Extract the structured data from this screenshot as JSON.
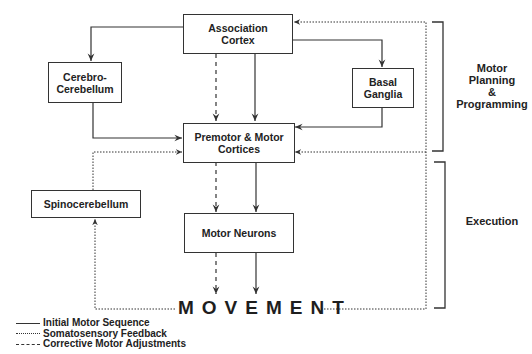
{
  "boxes": {
    "association_cortex": "Association\nCortex",
    "cerebro_cerebellum": "Cerebro-\nCerebellum",
    "basal_ganglia": "Basal\nGanglia",
    "premotor_motor": "Premotor & Motor\nCortices",
    "spinocerebellum": "Spinocerebellum",
    "motor_neurons": "Motor Neurons"
  },
  "output_label": "MOVEMENT",
  "phases": {
    "planning": "Motor\nPlanning\n&\nProgramming",
    "execution": "Execution"
  },
  "legend": [
    {
      "style": "solid",
      "label": "Initial Motor Sequence"
    },
    {
      "style": "dotted",
      "label": "Somatosensory Feedback"
    },
    {
      "style": "dashed",
      "label": "Corrective Motor Adjustments"
    }
  ],
  "colors": {
    "line": "#333333",
    "text": "#222222",
    "background": "#ffffff"
  }
}
